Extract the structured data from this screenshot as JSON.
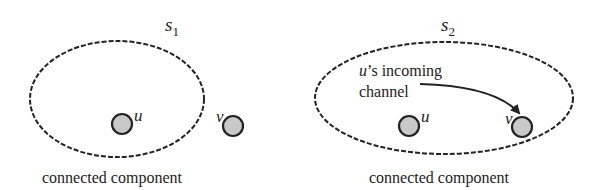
{
  "panels": [
    {
      "title": "s",
      "title_sub": "1",
      "caption": "connected component",
      "nodes": [
        {
          "label": "u",
          "inside": true
        },
        {
          "label": "v",
          "inside": false
        }
      ]
    },
    {
      "title": "s",
      "title_sub": "2",
      "caption": "connected component",
      "annotation_line1_var": "u",
      "annotation_line1_rest": "’s incoming",
      "annotation_line2": "channel",
      "nodes": [
        {
          "label": "u",
          "inside": true
        },
        {
          "label": "v",
          "inside": true
        }
      ]
    }
  ],
  "colors": {
    "node_fill": "#c8c8c8",
    "stroke": "#222222",
    "background": "#ffffff"
  }
}
